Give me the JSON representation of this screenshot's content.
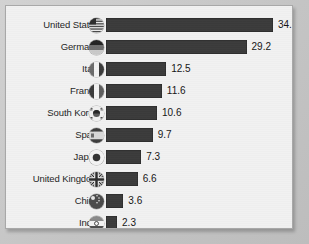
{
  "chart_data": {
    "type": "bar",
    "orientation": "horizontal",
    "title": "",
    "subtitle": "",
    "xlabel": "",
    "ylabel": "",
    "grid": false,
    "legend": null,
    "xlim": [
      0,
      34.7
    ],
    "categories": [
      "United States",
      "Germany",
      "Italy",
      "France",
      "South Korea",
      "Spain",
      "Japan",
      "United Kingdom",
      "China",
      "India"
    ],
    "values": [
      34.7,
      29.2,
      12.5,
      11.6,
      10.6,
      9.7,
      7.3,
      6.6,
      3.6,
      2.3
    ],
    "value_labels": [
      "34.7",
      "29.2",
      "12.5",
      "11.6",
      "10.6",
      "9.7",
      "7.3",
      "6.6",
      "3.6",
      "2.3"
    ],
    "flags": [
      "flag-united-states-icon",
      "flag-germany-icon",
      "flag-italy-icon",
      "flag-france-icon",
      "flag-south-korea-icon",
      "flag-spain-icon",
      "flag-japan-icon",
      "flag-united-kingdom-icon",
      "flag-china-icon",
      "flag-india-icon"
    ],
    "bar_color": "#3b3b3b",
    "plot_background": "#f1f1f1",
    "frame_border_color": "#a8a8a8",
    "page_background": "#c6c6c6"
  },
  "rows": [
    {
      "label": "United States",
      "value": "34.7",
      "flag": "flag-united-states-icon"
    },
    {
      "label": "Germany",
      "value": "29.2",
      "flag": "flag-germany-icon"
    },
    {
      "label": "Italy",
      "value": "12.5",
      "flag": "flag-italy-icon"
    },
    {
      "label": "France",
      "value": "11.6",
      "flag": "flag-france-icon"
    },
    {
      "label": "South Korea",
      "value": "10.6",
      "flag": "flag-south-korea-icon"
    },
    {
      "label": "Spain",
      "value": "9.7",
      "flag": "flag-spain-icon"
    },
    {
      "label": "Japan",
      "value": "7.3",
      "flag": "flag-japan-icon"
    },
    {
      "label": "United Kingdom",
      "value": "6.6",
      "flag": "flag-united-kingdom-icon"
    },
    {
      "label": "China",
      "value": "3.6",
      "flag": "flag-china-icon"
    },
    {
      "label": "India",
      "value": "2.3",
      "flag": "flag-india-icon"
    }
  ]
}
